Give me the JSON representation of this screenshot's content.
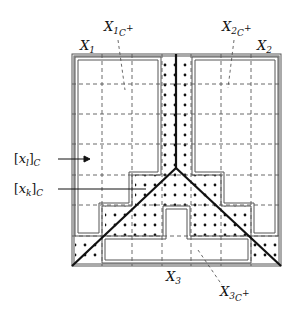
{
  "figure": {
    "labels": {
      "x1": {
        "base": "X",
        "sub": "1"
      },
      "x2": {
        "base": "X",
        "sub": "2"
      },
      "x3": {
        "base": "X",
        "sub": "3"
      },
      "x1c": {
        "base": "X",
        "sub": "1",
        "subsub": "C",
        "sup": "+"
      },
      "x2c": {
        "base": "X",
        "sub": "2",
        "subsub": "C",
        "sup": "+"
      },
      "x3c": {
        "base": "X",
        "sub": "3",
        "subsub": "C",
        "sup": "+"
      },
      "xl": {
        "open": "[",
        "var": "x",
        "idx": "l",
        "close": "]",
        "sub": "C"
      },
      "xk": {
        "open": "[",
        "var": "x",
        "idx": "k",
        "close": "]",
        "sub": "C"
      }
    },
    "grid": {
      "rows": 7,
      "cols": 7,
      "style": "dashed"
    },
    "colors": {
      "line": "#111111",
      "outline": "#555555",
      "dash": "#444444"
    }
  }
}
